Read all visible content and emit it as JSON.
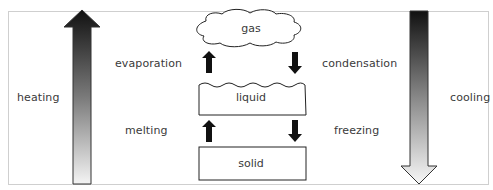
{
  "diagram": {
    "states": [
      {
        "id": "gas",
        "label": "gas",
        "shape": "cloud"
      },
      {
        "id": "liquid",
        "label": "liquid",
        "shape": "wavy-top-box"
      },
      {
        "id": "solid",
        "label": "solid",
        "shape": "box"
      }
    ],
    "transitions": {
      "evaporation": "evaporation",
      "condensation": "condensation",
      "melting": "melting",
      "freezing": "freezing"
    },
    "side_arrows": {
      "heating": {
        "label": "heating",
        "direction": "up",
        "gradient_top": "#111111",
        "gradient_bottom": "#f4f4f4"
      },
      "cooling": {
        "label": "cooling",
        "direction": "down",
        "gradient_top": "#111111",
        "gradient_bottom": "#f4f4f4"
      }
    },
    "colors": {
      "frame_border": "#cfcfcf",
      "outline": "#222222",
      "arrow_fill": "#111111",
      "text": "#3a3a3a"
    }
  }
}
